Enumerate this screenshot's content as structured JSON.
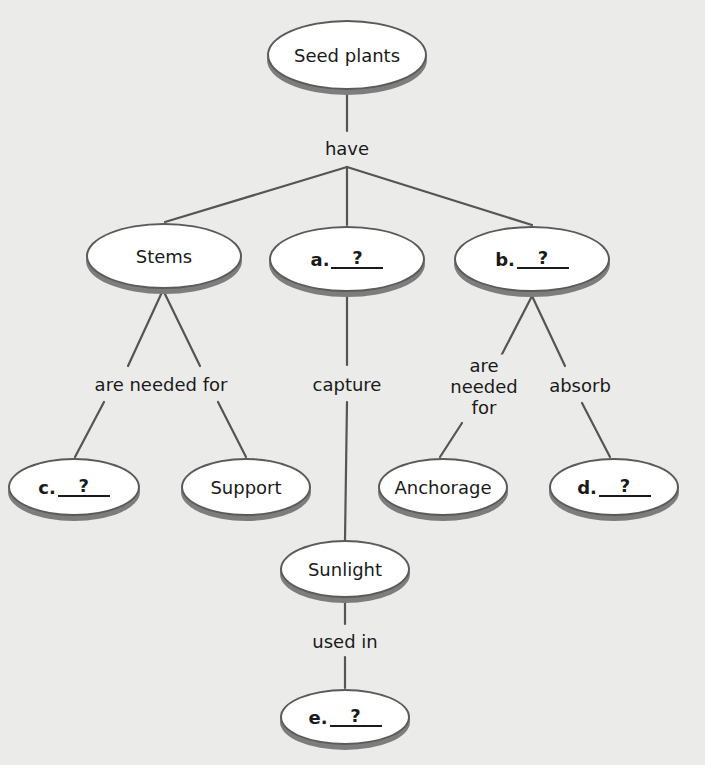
{
  "diagram": {
    "type": "concept-map",
    "nodes": {
      "root": {
        "label": "Seed plants"
      },
      "stems": {
        "label": "Stems"
      },
      "a": {
        "prefix": "a.",
        "blank": "?"
      },
      "b": {
        "prefix": "b.",
        "blank": "?"
      },
      "c": {
        "prefix": "c.",
        "blank": "?"
      },
      "support": {
        "label": "Support"
      },
      "anchorage": {
        "label": "Anchorage"
      },
      "d": {
        "prefix": "d.",
        "blank": "?"
      },
      "sunlight": {
        "label": "Sunlight"
      },
      "e": {
        "prefix": "e.",
        "blank": "?"
      }
    },
    "links": {
      "have": "have",
      "stems_needed_for": "are needed for",
      "capture": "capture",
      "b_needed_for_lines": [
        "are",
        "needed",
        "for"
      ],
      "absorb": "absorb",
      "used_in": "used in"
    },
    "colors": {
      "background": "#ebebea",
      "node_fill": "#ffffff",
      "node_border": "#5a5a5a",
      "node_shadow": "#7d7d7d",
      "line": "#555555",
      "text": "#1a1a1a"
    }
  }
}
